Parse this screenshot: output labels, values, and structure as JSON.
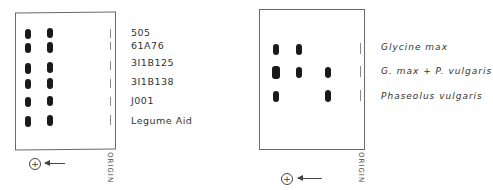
{
  "left_panel": {
    "box": {
      "x": 15,
      "y": 12,
      "w": 99,
      "h": 136
    },
    "labels": [
      {
        "text": "505",
        "y": 31
      },
      {
        "text": "61A76",
        "y": 44
      },
      {
        "text": "3I1B125",
        "y": 58
      },
      {
        "text": "3I1B138",
        "y": 77
      },
      {
        "text": "J001",
        "y": 96
      },
      {
        "text": "Legume Aid",
        "y": 115
      }
    ],
    "origin_label": "ORIGIN",
    "anode_symbol": "+"
  },
  "right_panel": {
    "box": {
      "x": 259,
      "y": 9,
      "w": 104,
      "h": 139
    },
    "labels": [
      {
        "text": "Glycine max",
        "y": 42
      },
      {
        "text": "G. max + P. vulgaris",
        "y": 66
      },
      {
        "text": "Phaseolus vulgaris",
        "y": 91
      }
    ],
    "origin_label": "ORIGIN",
    "anode_symbol": "+"
  },
  "colors": {
    "band": "#1a1a1a",
    "border": "#6a6a6a",
    "text": "#333333"
  }
}
